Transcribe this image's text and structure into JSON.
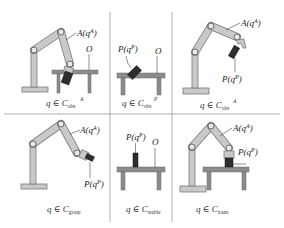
{
  "colors": {
    "arm_fill": "#c9c9c9",
    "arm_stroke": "#7a7a7a",
    "table_fill": "#8c8c8c",
    "object_fill": "#2e2e2e",
    "grid": "#9a9a9a",
    "text": "#222222"
  },
  "panels": [
    {
      "id": "obs-A-top",
      "label_A": "A(q",
      "label_A_sup": "A",
      "label_O": "O",
      "caption_main": "q ∈ C",
      "caption_sub": "obs",
      "caption_sup": "A"
    },
    {
      "id": "obs-P",
      "label_P": "P(q",
      "label_P_sup": "P",
      "label_O": "O",
      "caption_main": "q ∈ C",
      "caption_sub": "obs",
      "caption_sup": "P"
    },
    {
      "id": "obs-A-right",
      "label_A": "A(q",
      "label_A_sup": "A",
      "label_P": "P(q",
      "label_P_sup": "P",
      "caption_main": "q ∈ C",
      "caption_sub": "obs",
      "caption_sup": "A"
    },
    {
      "id": "grasp",
      "label_A": "A(q",
      "label_A_sup": "A",
      "label_P": "P(q",
      "label_P_sup": "P",
      "caption_main": "q ∈ C",
      "caption_sub": "grasp"
    },
    {
      "id": "stable",
      "label_P": "P(q",
      "label_P_sup": "P",
      "label_O": "O",
      "caption_main": "q ∈ C",
      "caption_sub": "stable"
    },
    {
      "id": "trans",
      "label_A": "A(q",
      "label_A_sup": "A",
      "label_P": "P(q",
      "label_P_sup": "P",
      "caption_main": "q ∈ C",
      "caption_sub": "trans"
    }
  ],
  "close_paren": ")"
}
